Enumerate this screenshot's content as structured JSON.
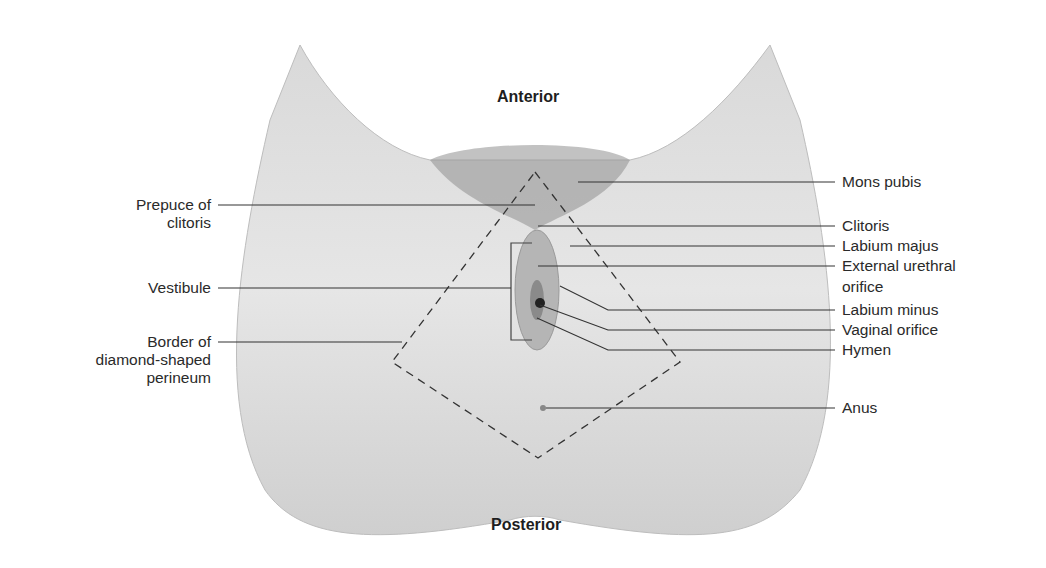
{
  "figure": {
    "orientation": {
      "top": "Anterior",
      "bottom": "Posterior"
    },
    "left_labels": [
      {
        "id": "prepuce",
        "line1": "Prepuce of",
        "line2": "clitoris"
      },
      {
        "id": "vestibule",
        "line1": "Vestibule",
        "line2": ""
      },
      {
        "id": "border",
        "line1": "Border of",
        "line2": "diamond-shaped",
        "line3": "perineum"
      }
    ],
    "right_labels": [
      {
        "id": "mons",
        "line1": "Mons pubis"
      },
      {
        "id": "clitoris",
        "line1": "Clitoris"
      },
      {
        "id": "labium-majus",
        "line1": "Labium majus"
      },
      {
        "id": "urethral",
        "line1": "External urethral",
        "line2": "orifice"
      },
      {
        "id": "labium-minus",
        "line1": "Labium minus"
      },
      {
        "id": "vaginal",
        "line1": "Vaginal orifice"
      },
      {
        "id": "hymen",
        "line1": "Hymen"
      },
      {
        "id": "anus",
        "line1": "Anus"
      }
    ],
    "colors": {
      "text": "#2a2a2a",
      "leader": "#333333",
      "figure_light": "#ececec",
      "figure_dark": "#9a9a9a",
      "dashed": "#333333"
    }
  }
}
